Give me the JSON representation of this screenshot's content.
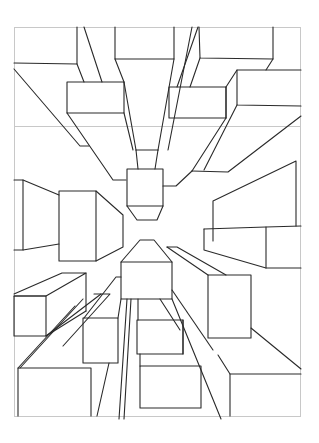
{
  "drawing": {
    "subject": "one-point perspective city buildings viewed from below",
    "style": "black line art on white",
    "colors": {
      "background": "#ffffff",
      "line": "#2a2a2a",
      "frame": "#c8c8c8"
    }
  }
}
